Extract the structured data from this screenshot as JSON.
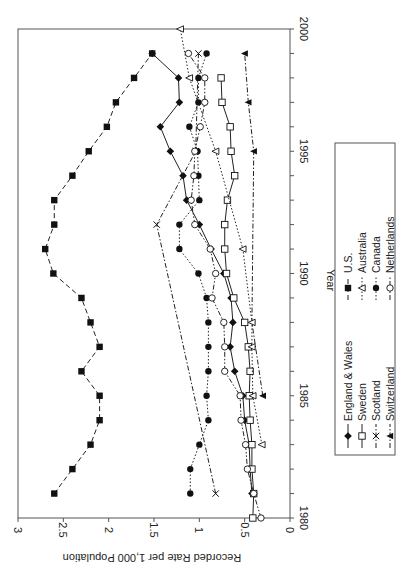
{
  "chart_data": {
    "type": "line",
    "orientation": "rotated-90-clockwise",
    "title": "",
    "xlabel": "Year",
    "ylabel": "Recorded Rate per 1,000 Population",
    "xlim": [
      1980,
      2000
    ],
    "ylim": [
      0,
      3
    ],
    "x_ticks": [
      1980,
      1985,
      1990,
      1995,
      2000
    ],
    "y_ticks": [
      0,
      0.5,
      1,
      1.5,
      2,
      2.5,
      3
    ],
    "y_tick_labels": [
      "0",
      "0.5",
      "1",
      "1.5",
      "2",
      "2.5",
      "3"
    ],
    "grid": false,
    "legend_position": "right (below plot when unrotated)",
    "series": [
      {
        "name": "England & Wales",
        "marker": "diamond-filled",
        "line": "solid",
        "x": [
          1981,
          1982,
          1983,
          1984,
          1985,
          1986,
          1987,
          1988,
          1989,
          1990,
          1991,
          1992,
          1993,
          1994,
          1995,
          1996,
          1997,
          1998,
          1999
        ],
        "values": [
          0.42,
          0.44,
          0.45,
          0.5,
          0.52,
          0.61,
          0.66,
          0.63,
          0.65,
          0.73,
          0.87,
          1.0,
          1.14,
          1.18,
          1.32,
          1.43,
          1.22,
          1.23,
          1.52
        ]
      },
      {
        "name": "Sweden",
        "marker": "square-open",
        "line": "solid",
        "x": [
          1980,
          1981,
          1982,
          1983,
          1984,
          1985,
          1986,
          1987,
          1988,
          1989,
          1990,
          1991,
          1992,
          1993,
          1994,
          1995,
          1996,
          1997,
          1998
        ],
        "values": [
          0.41,
          0.4,
          0.42,
          0.42,
          0.44,
          0.45,
          0.44,
          0.46,
          0.5,
          0.62,
          0.7,
          0.72,
          0.72,
          0.69,
          0.61,
          0.65,
          0.66,
          0.75,
          0.76
        ]
      },
      {
        "name": "Scotland",
        "marker": "x",
        "line": "dash-dot",
        "x": [
          1981,
          1992,
          1995,
          1999
        ],
        "values": [
          0.82,
          1.47,
          1.04,
          1.01
        ]
      },
      {
        "name": "Switzerland",
        "marker": "triangle-filled",
        "line": "dash-dot",
        "x": [
          1985,
          1988,
          1995,
          1997,
          1999
        ],
        "values": [
          0.3,
          0.42,
          0.4,
          0.46,
          0.5
        ]
      },
      {
        "name": "U.S.",
        "marker": "square-filled",
        "line": "dashed",
        "x": [
          1981,
          1982,
          1983,
          1984,
          1985,
          1986,
          1987,
          1988,
          1989,
          1990,
          1991,
          1992,
          1993,
          1994,
          1995,
          1996,
          1997,
          1998,
          1999
        ],
        "values": [
          2.6,
          2.4,
          2.2,
          2.1,
          2.1,
          2.3,
          2.1,
          2.2,
          2.3,
          2.61,
          2.7,
          2.6,
          2.6,
          2.4,
          2.22,
          2.02,
          1.92,
          1.72,
          1.52
        ]
      },
      {
        "name": "Australia",
        "marker": "triangle-open",
        "line": "dotted",
        "x": [
          1983,
          1985,
          1987,
          1988,
          1991,
          1995,
          1998,
          2000
        ],
        "values": [
          0.31,
          0.41,
          0.42,
          0.42,
          0.52,
          0.82,
          1.11,
          1.21
        ]
      },
      {
        "name": "Canada",
        "marker": "circle-filled",
        "line": "dotted",
        "x": [
          1981,
          1982,
          1983,
          1984,
          1985,
          1986,
          1987,
          1988,
          1989,
          1990,
          1991,
          1992,
          1993,
          1994,
          1995,
          1996,
          1997,
          1998,
          1999
        ],
        "values": [
          1.1,
          1.1,
          1.0,
          0.9,
          0.92,
          0.9,
          0.9,
          0.9,
          0.92,
          1.01,
          1.22,
          1.22,
          1.0,
          1.01,
          1.02,
          1.11,
          1.01,
          1.01,
          0.92
        ]
      },
      {
        "name": "Netherlands",
        "marker": "circle-open",
        "line": "dash-dot-dot",
        "x": [
          1980,
          1981,
          1982,
          1983,
          1984,
          1985,
          1986,
          1987,
          1988,
          1989,
          1990,
          1991,
          1992,
          1993,
          1994,
          1995,
          1996,
          1997,
          1998,
          1999
        ],
        "values": [
          0.32,
          0.4,
          0.47,
          0.49,
          0.54,
          0.55,
          0.72,
          0.72,
          0.73,
          0.86,
          0.82,
          0.88,
          1.05,
          1.09,
          1.06,
          1.05,
          0.99,
          0.94,
          0.94,
          1.12
        ]
      }
    ]
  },
  "legend": {
    "items": [
      {
        "label": "England & Wales"
      },
      {
        "label": "Sweden"
      },
      {
        "label": "Scotland"
      },
      {
        "label": "Switzerland"
      },
      {
        "label": "U.S."
      },
      {
        "label": "Australia"
      },
      {
        "label": "Canada"
      },
      {
        "label": "Netherlands"
      }
    ]
  },
  "axes": {
    "x_title": "Year",
    "y_title": "Recorded Rate per 1,000 Population"
  }
}
